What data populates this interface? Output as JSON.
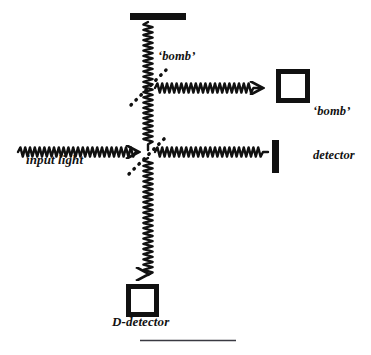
{
  "figure": {
    "background_color": "#ffffff",
    "ink_color": "#111111",
    "width": 371,
    "height": 355
  },
  "labels": {
    "bomb": "‘bomb’",
    "bomb_detector_line1": "‘bomb’",
    "bomb_detector_line2": "detector",
    "input_light": "input light",
    "d_detector": "D-detector"
  },
  "components": {
    "top_mirror": {
      "name": "top mirror",
      "shape": "horizontal bar",
      "x": 130,
      "y": 13,
      "width": 56,
      "height": 7
    },
    "right_mirror": {
      "name": "right mirror",
      "shape": "vertical bar",
      "x": 272,
      "y": 140,
      "width": 7,
      "height": 33
    },
    "beam_splitter_lower": {
      "name": "beam splitter",
      "shape": "dotted diagonal",
      "center_x": 148,
      "center_y": 155,
      "angle_deg": 45
    },
    "beam_splitter_upper": {
      "name": "bomb beam splitter",
      "shape": "dotted diagonal",
      "center_x": 148,
      "center_y": 88,
      "angle_deg": 45
    },
    "bomb_detector_box": {
      "name": "bomb detector",
      "shape": "open square",
      "x": 276,
      "y": 69,
      "size": 32,
      "border": 5
    },
    "d_detector_box": {
      "name": "D-detector",
      "shape": "open square",
      "x": 126,
      "y": 284,
      "size": 31,
      "border": 5
    },
    "bottom_rule": {
      "name": "caption rule",
      "x1": 140,
      "x2": 236,
      "y": 340
    }
  },
  "beams": [
    {
      "id": "input-beam",
      "label": "input light",
      "orientation": "horizontal",
      "from_x": 18,
      "to_x": 146,
      "y": 152,
      "arrow": "right"
    },
    {
      "id": "transmitted-beam",
      "label": "to right mirror",
      "orientation": "horizontal",
      "from_x": 152,
      "to_x": 271,
      "y": 152,
      "arrow": "none"
    },
    {
      "id": "reflected-up-beam",
      "label": "to top mirror",
      "orientation": "vertical",
      "from_y": 22,
      "to_y": 150,
      "x": 148,
      "arrow": "none"
    },
    {
      "id": "bomb-output-beam",
      "label": "to bomb detector",
      "orientation": "horizontal",
      "from_x": 152,
      "to_x": 274,
      "y": 88,
      "arrow": "right"
    },
    {
      "id": "d-output-beam",
      "label": "to D-detector",
      "orientation": "vertical",
      "from_y": 158,
      "to_y": 283,
      "x": 148,
      "arrow": "down"
    }
  ]
}
